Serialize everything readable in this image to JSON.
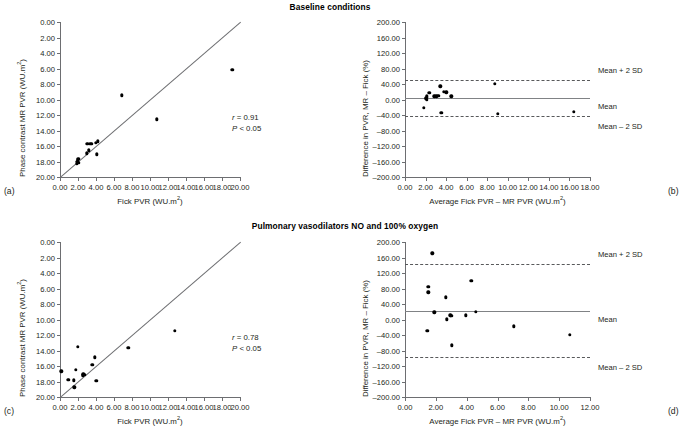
{
  "figure": {
    "panels": [
      {
        "letter": "(a)",
        "title": "Baseline conditions",
        "type": "scatter",
        "xlabel": "Fick PVR (WU.m",
        "xlabel_sup": "2",
        "xlabel_tail": ")",
        "ylabel": "Phase contrast MR PVR (WU.m",
        "ylabel_sup": "2",
        "ylabel_tail": ")",
        "xticks": [
          "0.00",
          "2.00",
          "4.00",
          "6.00",
          "8.00",
          "10.00",
          "12.00",
          "14.00",
          "16.00",
          "18.00",
          "20.00"
        ],
        "yticks": [
          "0.00",
          "2.00",
          "4.00",
          "6.00",
          "8.00",
          "10.00",
          "12.00",
          "14.00",
          "16.00",
          "18.00",
          "20.00"
        ],
        "xlim": [
          0,
          20
        ],
        "ylim": [
          0,
          20
        ],
        "identity_line": true,
        "stats": {
          "r_label": "r",
          "r_value": "= 0.91",
          "p_label": "P",
          "p_value": "< 0.05"
        },
        "points": [
          [
            1.9,
            1.7
          ],
          [
            1.92,
            1.95
          ],
          [
            1.95,
            2.1
          ],
          [
            1.98,
            2.25
          ],
          [
            2.02,
            2.35
          ],
          [
            2.05,
            1.85
          ],
          [
            2.95,
            3.05
          ],
          [
            3.05,
            4.25
          ],
          [
            3.2,
            3.45
          ],
          [
            3.35,
            4.25
          ],
          [
            3.55,
            4.3
          ],
          [
            3.95,
            4.45
          ],
          [
            4.2,
            4.6
          ],
          [
            4.1,
            2.95
          ],
          [
            6.9,
            10.55
          ],
          [
            10.75,
            7.45
          ],
          [
            19.15,
            13.85
          ]
        ]
      },
      {
        "letter": "(b)",
        "title": "",
        "type": "bland-altman",
        "xlabel": "Average Fick PVR – MR PVR (WU.m",
        "xlabel_sup": "2",
        "xlabel_tail": ")",
        "ylabel": "Difference in PVR, MR – Fick (%)",
        "xticks": [
          "0.00",
          "2.00",
          "4.00",
          "6.00",
          "8.00",
          "10.00",
          "12.00",
          "14.00",
          "16.00",
          "18.00"
        ],
        "yticks": [
          "200.00",
          "160.00",
          "120.00",
          "80.00",
          "40.00",
          "0.00",
          "–40.00",
          "–80.00",
          "–120.00",
          "–160.00",
          "–200.00"
        ],
        "xlim": [
          0,
          18
        ],
        "ylim": [
          -200,
          200
        ],
        "mean": 4.0,
        "upper_sd": 50.0,
        "lower_sd": -42.0,
        "mean_label": "Mean",
        "upper_label": "Mean + 2 SD",
        "lower_label": "Mean – 2 SD",
        "points": [
          [
            1.8,
            -21.0
          ],
          [
            2.05,
            2.0
          ],
          [
            2.08,
            5.0
          ],
          [
            2.1,
            -1.0
          ],
          [
            2.12,
            8.0
          ],
          [
            2.35,
            17.0
          ],
          [
            2.85,
            8.0
          ],
          [
            3.05,
            8.0
          ],
          [
            3.25,
            9.0
          ],
          [
            3.45,
            34.0
          ],
          [
            3.55,
            -34.0
          ],
          [
            3.8,
            20.0
          ],
          [
            4.0,
            19.0
          ],
          [
            4.5,
            8.0
          ],
          [
            8.75,
            41.0
          ],
          [
            9.05,
            -37.0
          ],
          [
            16.45,
            -32.0
          ]
        ]
      },
      {
        "letter": "(c)",
        "title": "Pulmonary vasodilators NO and 100% oxygen",
        "type": "scatter",
        "xlabel": "Fick PVR (WU.m",
        "xlabel_sup": "2",
        "xlabel_tail": ")",
        "ylabel": "Phase contrast MR PVR (WU.m",
        "ylabel_sup": "2",
        "ylabel_tail": ")",
        "xticks": [
          "0.00",
          "2.00",
          "4.00",
          "6.00",
          "8.00",
          "10.00",
          "12.00",
          "14.00",
          "16.00",
          "18.00",
          "20.00"
        ],
        "yticks": [
          "0.00",
          "2.00",
          "4.00",
          "6.00",
          "8.00",
          "10.00",
          "12.00",
          "14.00",
          "16.00",
          "18.00",
          "20.00"
        ],
        "xlim": [
          0,
          20
        ],
        "ylim": [
          0,
          20
        ],
        "identity_line": true,
        "stats": {
          "r_label": "r",
          "r_value": "= 0.78",
          "p_label": "P",
          "p_value": "< 0.05"
        },
        "points": [
          [
            0.15,
            3.3
          ],
          [
            0.85,
            2.2
          ],
          [
            0.95,
            2.2
          ],
          [
            1.55,
            2.15
          ],
          [
            1.6,
            1.25
          ],
          [
            1.75,
            3.5
          ],
          [
            2.0,
            6.5
          ],
          [
            2.55,
            2.8
          ],
          [
            2.6,
            2.95
          ],
          [
            2.7,
            2.85
          ],
          [
            3.6,
            4.15
          ],
          [
            3.85,
            5.1
          ],
          [
            4.05,
            2.1
          ],
          [
            7.6,
            6.35
          ],
          [
            12.75,
            8.55
          ]
        ]
      },
      {
        "letter": "(d)",
        "title": "",
        "type": "bland-altman",
        "xlabel": "Average Fick PVR – MR PVR (WU.m",
        "xlabel_sup": "2",
        "xlabel_tail": ")",
        "ylabel": "Difference in PVR, MR – Fick (%)",
        "xticks": [
          "0.00",
          "2.00",
          "4.00",
          "6.00",
          "8.00",
          "10.00",
          "12.00"
        ],
        "yticks": [
          "200.00",
          "160.00",
          "120.00",
          "80.00",
          "40.00",
          "0.00",
          "–40.00",
          "–80.00",
          "–120.00",
          "–160.00",
          "–200.00"
        ],
        "xlim": [
          0,
          12
        ],
        "ylim": [
          -200,
          200
        ],
        "mean": 23.0,
        "upper_sd": 142.0,
        "lower_sd": -97.0,
        "mean_label": "Mean",
        "upper_label": "Mean + 2 SD",
        "lower_label": "Mean – 2 SD",
        "points": [
          [
            1.45,
            -29.0
          ],
          [
            1.5,
            84.0
          ],
          [
            1.52,
            70.0
          ],
          [
            1.78,
            171.0
          ],
          [
            1.9,
            19.0
          ],
          [
            2.65,
            57.0
          ],
          [
            2.7,
            1.0
          ],
          [
            2.95,
            11.0
          ],
          [
            3.0,
            10.0
          ],
          [
            3.05,
            -67.0
          ],
          [
            3.95,
            11.0
          ],
          [
            4.3,
            100.0
          ],
          [
            4.6,
            20.0
          ],
          [
            7.05,
            -18.0
          ],
          [
            10.7,
            -40.0
          ]
        ]
      }
    ]
  }
}
